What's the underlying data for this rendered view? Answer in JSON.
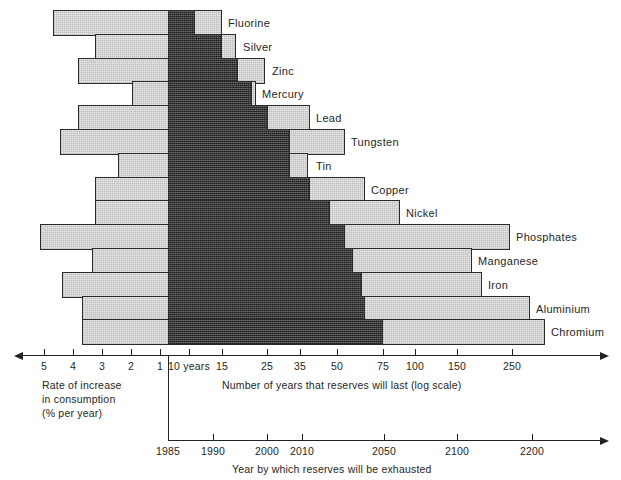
{
  "chart_data": {
    "type": "bar",
    "title": "",
    "subtitle": "",
    "orientation": "horizontal",
    "axis_top": {
      "label_left": "Rate of increase in consumption (% per year)",
      "label_right": "Number of years that reserves will last (log scale)",
      "ticks_left": [
        "5",
        "4",
        "3",
        "2",
        "1"
      ],
      "ticks_right": [
        "10 years",
        "15",
        "25",
        "35",
        "50",
        "75",
        "100",
        "150",
        "250"
      ],
      "scale": "log"
    },
    "axis_bottom": {
      "label": "Year by which reserves will be exhausted",
      "ticks": [
        "1985",
        "1990",
        "2000",
        "2010",
        "2050",
        "2100",
        "2200"
      ]
    },
    "origin_year": "1985",
    "categories": [
      "Fluorine",
      "Silver",
      "Zinc",
      "Mercury",
      "Lead",
      "Tungsten",
      "Tin",
      "Copper",
      "Nickel",
      "Phosphates",
      "Manganese",
      "Iron",
      "Aluminium",
      "Chromium"
    ],
    "series": [
      {
        "name": "Fluorine",
        "rate_of_increase_percent_per_year": 4.2,
        "years_static_reserve": 15,
        "years_exponential_low": 10,
        "years_exponential_high": 12
      },
      {
        "name": "Silver",
        "rate_of_increase_percent_per_year": 2.7,
        "years_static_reserve": 16,
        "years_exponential_low": 10,
        "years_exponential_high": 15
      },
      {
        "name": "Zinc",
        "rate_of_increase_percent_per_year": 2.9,
        "years_static_reserve": 23,
        "years_exponential_low": 10,
        "years_exponential_high": 19
      },
      {
        "name": "Mercury",
        "rate_of_increase_percent_per_year": 1.0,
        "years_static_reserve": 21,
        "years_exponential_low": 10,
        "years_exponential_high": 21
      },
      {
        "name": "Lead",
        "rate_of_increase_percent_per_year": 2.8,
        "years_static_reserve": 30,
        "years_exponential_low": 10,
        "years_exponential_high": 25
      },
      {
        "name": "Tungsten",
        "rate_of_increase_percent_per_year": 3.0,
        "years_static_reserve": 40,
        "years_exponential_low": 10,
        "years_exponential_high": 30
      },
      {
        "name": "Tin",
        "rate_of_increase_percent_per_year": 1.0,
        "years_static_reserve": 33,
        "years_exponential_low": 10,
        "years_exponential_high": 30
      },
      {
        "name": "Copper",
        "rate_of_increase_percent_per_year": 2.9,
        "years_static_reserve": 45,
        "years_exponential_low": 10,
        "years_exponential_high": 36
      },
      {
        "name": "Nickel",
        "rate_of_increase_percent_per_year": 2.9,
        "years_static_reserve": 60,
        "years_exponential_low": 10,
        "years_exponential_high": 45
      },
      {
        "name": "Phosphates",
        "rate_of_increase_percent_per_year": 5.3,
        "years_static_reserve": 250,
        "years_exponential_low": 10,
        "years_exponential_high": 52
      },
      {
        "name": "Manganese",
        "rate_of_increase_percent_per_year": 3.0,
        "years_static_reserve": 180,
        "years_exponential_low": 10,
        "years_exponential_high": 57
      },
      {
        "name": "Iron",
        "rate_of_increase_percent_per_year": 3.9,
        "years_static_reserve": 200,
        "years_exponential_low": 10,
        "years_exponential_high": 62
      },
      {
        "name": "Aluminium",
        "rate_of_increase_percent_per_year": 3.3,
        "years_static_reserve": 290,
        "years_exponential_low": 10,
        "years_exponential_high": 64
      },
      {
        "name": "Chromium",
        "rate_of_increase_percent_per_year": 3.3,
        "years_static_reserve": 330,
        "years_exponential_low": 10,
        "years_exponential_high": 77
      }
    ],
    "legend_position": "none",
    "grid": false
  },
  "bars": [
    {
      "label": "Fluorine",
      "light_start_px": 53,
      "dark_start_px": 168,
      "dark_end_px": 195,
      "light_end_px": 222,
      "label_x_px": 228
    },
    {
      "label": "Silver",
      "light_start_px": 95,
      "dark_start_px": 168,
      "dark_end_px": 222,
      "light_end_px": 236,
      "label_x_px": 243
    },
    {
      "label": "Zinc",
      "light_start_px": 78,
      "dark_start_px": 168,
      "dark_end_px": 238,
      "light_end_px": 265,
      "label_x_px": 272
    },
    {
      "label": "Mercury",
      "light_start_px": 132,
      "dark_start_px": 168,
      "dark_end_px": 252,
      "light_end_px": 256,
      "label_x_px": 262
    },
    {
      "label": "Lead",
      "light_start_px": 78,
      "dark_start_px": 168,
      "dark_end_px": 268,
      "light_end_px": 310,
      "label_x_px": 316
    },
    {
      "label": "Tungsten",
      "light_start_px": 60,
      "dark_start_px": 168,
      "dark_end_px": 290,
      "light_end_px": 345,
      "label_x_px": 351
    },
    {
      "label": "Tin",
      "light_start_px": 118,
      "dark_start_px": 168,
      "dark_end_px": 290,
      "light_end_px": 308,
      "label_x_px": 316
    },
    {
      "label": "Copper",
      "light_start_px": 95,
      "dark_start_px": 168,
      "dark_end_px": 310,
      "light_end_px": 365,
      "label_x_px": 371
    },
    {
      "label": "Nickel",
      "light_start_px": 95,
      "dark_start_px": 168,
      "dark_end_px": 330,
      "light_end_px": 400,
      "label_x_px": 406
    },
    {
      "label": "Phosphates",
      "light_start_px": 40,
      "dark_start_px": 168,
      "dark_end_px": 345,
      "light_end_px": 510,
      "label_x_px": 516
    },
    {
      "label": "Manganese",
      "light_start_px": 92,
      "dark_start_px": 168,
      "dark_end_px": 353,
      "light_end_px": 472,
      "label_x_px": 478
    },
    {
      "label": "Iron",
      "light_start_px": 62,
      "dark_start_px": 168,
      "dark_end_px": 362,
      "light_end_px": 482,
      "label_x_px": 488
    },
    {
      "label": "Aluminium",
      "light_start_px": 82,
      "dark_start_px": 168,
      "dark_end_px": 365,
      "light_end_px": 530,
      "label_x_px": 536
    },
    {
      "label": "Chromium",
      "light_start_px": 82,
      "dark_start_px": 168,
      "dark_end_px": 383,
      "light_end_px": 545,
      "label_x_px": 551
    }
  ],
  "top_axis": {
    "ticks": [
      {
        "text": "5",
        "x_px": 44
      },
      {
        "text": "4",
        "x_px": 73
      },
      {
        "text": "3",
        "x_px": 102
      },
      {
        "text": "2",
        "x_px": 131
      },
      {
        "text": "1",
        "x_px": 160
      },
      {
        "text": "10 years",
        "x_px": 189
      },
      {
        "text": "15",
        "x_px": 222
      },
      {
        "text": "25",
        "x_px": 267
      },
      {
        "text": "35",
        "x_px": 300
      },
      {
        "text": "50",
        "x_px": 337
      },
      {
        "text": "75",
        "x_px": 383
      },
      {
        "text": "100",
        "x_px": 415
      },
      {
        "text": "150",
        "x_px": 457
      },
      {
        "text": "250",
        "x_px": 512
      }
    ],
    "caption_left": "Rate of increase\nin consumption\n(% per year)",
    "caption_right": "Number of years that reserves will last (log scale)"
  },
  "bottom_axis": {
    "ticks": [
      {
        "text": "1985",
        "x_px": 168
      },
      {
        "text": "1990",
        "x_px": 213
      },
      {
        "text": "2000",
        "x_px": 267
      },
      {
        "text": "2010",
        "x_px": 302
      },
      {
        "text": "2050",
        "x_px": 384
      },
      {
        "text": "2100",
        "x_px": 457
      },
      {
        "text": "2200",
        "x_px": 532
      }
    ],
    "caption": "Year by which reserves will be exhausted"
  },
  "colors": {
    "bar_light": "#e8e8e6",
    "bar_dark": "#4a4a4a",
    "outline": "#2a2a2a",
    "text": "#262626",
    "background": "#ffffff"
  }
}
